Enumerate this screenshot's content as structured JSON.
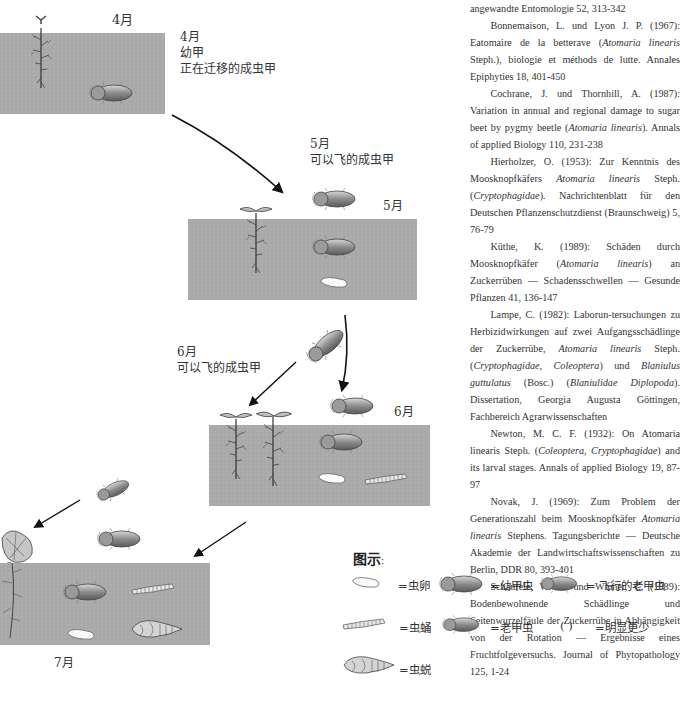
{
  "diagram": {
    "april": {
      "month_top": "4月",
      "month_side": "4月",
      "line1": "幼甲",
      "line2": "正在迁移的成虫甲"
    },
    "may": {
      "month_label": "5月",
      "caption": "可以飞的成虫甲",
      "month_side": "5月"
    },
    "june": {
      "month_label": "6月",
      "caption": "可以飞的成虫甲",
      "month_side": "6月"
    },
    "july": {
      "month_bottom": "7月"
    },
    "colors": {
      "soil": "#a9a9a9",
      "arrow": "#111111"
    }
  },
  "references": [
    {
      "text": "angewandte Entomologie 52, 313-342",
      "continuation": true
    },
    {
      "pre": "Bonnemaison, L. und Lyon J. P. (1967): Eatomaire de la betterave (",
      "italic": "Atomaria linearis",
      "post": " Steph.), biologie et méthods de lutte. Annales Epiphyties 18, 401-450"
    },
    {
      "pre": "Cochrane, J. und Thornhill, A. (1987): Variation in annual and regional damage to sugar beet by pygmy beetle (",
      "italic": "Atomaria linearis",
      "post": "). Annals of applied Biology 110, 231-238"
    },
    {
      "pre": "Hierholzer, O. (1953): Zur Kenntnis des Moosknopfkäfers ",
      "italic": "Atomaria linearis",
      "post": " Steph. (",
      "italic2": "Cryptophagidae",
      "post2": "). Nachrichtenblatt für den Deutschen Pflanzenschutzdienst (Braunschweig) 5, 76-79"
    },
    {
      "pre": "Küthe, K. (1989): Schäden durch Moosknopfkäfer (",
      "italic": "Atomaria linearis",
      "post": ") an Zuckerrüben — Schadensschwellen — Gesunde Pflanzen 41, 136-147"
    },
    {
      "pre": "Lampe, C. (1982): Laborun-tersuchungen zu Herbizidwirkungen auf zwei Aufgangsschädlinge der Zuckerrübe, ",
      "italic": "Atomaria linearis",
      "post": " Steph. (",
      "italic2": "Cryptophagidae, Coleoptera",
      "post2": ") und ",
      "italic3": "Blaniulus guttulatus",
      "post3": " (Bosc.) (",
      "italic4": "Blaniulidae Diplopoda",
      "post4": "). Dissertation, Georgia Augusta Göttingen, Fachbereich Agrarwissenschaften"
    },
    {
      "pre": "Newton, M. C. F. (1932): On Atomaria linearis Steph. (",
      "italic": "Coleoptera, Cryptophagidae",
      "post": ") and its larval stages. Annals of applied Biology 19, 87-97"
    },
    {
      "pre": "Novak, J. (1969): Zum Problem der Generationszahl beim Moosknopfkäfer ",
      "italic": "Atomaria linearis",
      "post": " Stephens. Tagungsberichte — Deutsche Akademie der Landwirtschaftswissenschaften zu Berlin, DDR 80, 393-401"
    },
    {
      "pre": "Schäufele, W. R. und Winner, C. (1989): Bodenbewohnende Schädlinge und Seitenwurzelfäule der Zuckerrübe in Abhängigkeit von der Rotation — Ergebnisse eines Fruchtfolgeversuchs. Journal of Phytopathology 125, 1-24"
    }
  ],
  "legend": {
    "title": "图示",
    "title_colon": ":",
    "items": [
      {
        "icon": "egg-icon",
        "label": "=虫卵"
      },
      {
        "icon": "young-beetle-icon",
        "label": "=幼甲虫"
      },
      {
        "icon": "flying-beetle-icon",
        "label": "= 飞行的老甲虫"
      },
      {
        "icon": "larva-icon",
        "label": "=虫蛹"
      },
      {
        "icon": "old-beetle-icon",
        "label": "=老甲虫"
      },
      {
        "icon": "parentheses-icon",
        "symbol": "(    )",
        "label": "=明显更少"
      },
      {
        "icon": "pupa-icon",
        "label": "=虫蜕"
      }
    ]
  }
}
